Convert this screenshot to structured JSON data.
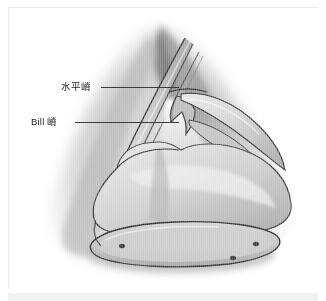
{
  "figure": {
    "type": "anatomical-illustration",
    "style": "grayscale pencil / airbrush medical drawing",
    "background_color": "#ffffff",
    "frame_color": "#e8e8e8",
    "ink_color": "#3a3a3a",
    "bottom_band_color": "#f2f2f2"
  },
  "callouts": [
    {
      "id": "horizontal-crest",
      "label": "水平嵴",
      "leader": {
        "x": 92,
        "y": 79,
        "length": 78
      }
    },
    {
      "id": "bill-crest",
      "label": "Bill 嵴",
      "leader": {
        "x": 66,
        "y": 114,
        "length": 104
      }
    }
  ]
}
